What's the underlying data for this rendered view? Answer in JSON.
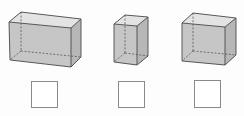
{
  "diagram": {
    "type": "cuboid-comparison-worksheet",
    "colors": {
      "background": "#fdfdfd",
      "front_face": "#c6c6c6",
      "top_face": "#e3e3e3",
      "side_face": "#b7b7b7",
      "edge": "#4a4a4a",
      "hidden_edge": "#555555",
      "answer_border": "#8a8a8a"
    },
    "cuboids": [
      {
        "name": "cuboid-1-wide",
        "front": {
          "tl": [
            9,
            22
          ],
          "tr": [
            71,
            28
          ],
          "br": [
            71,
            67
          ],
          "bl": [
            10,
            60
          ]
        },
        "back": {
          "tl": [
            21,
            12
          ],
          "tr": [
            81,
            19
          ],
          "br": [
            81,
            57
          ],
          "bl": [
            21,
            51
          ]
        }
      },
      {
        "name": "cuboid-2-tall",
        "front": {
          "tl": [
            114,
            24
          ],
          "tr": [
            137,
            26
          ],
          "br": [
            137,
            65
          ],
          "bl": [
            114,
            62
          ]
        },
        "back": {
          "tl": [
            125,
            15
          ],
          "tr": [
            148,
            17
          ],
          "br": [
            148,
            56
          ],
          "bl": [
            125,
            53
          ]
        }
      },
      {
        "name": "cuboid-3-medium",
        "front": {
          "tl": [
            182,
            23
          ],
          "tr": [
            225,
            27
          ],
          "br": [
            225,
            65
          ],
          "bl": [
            182,
            61
          ]
        },
        "back": {
          "tl": [
            193,
            13
          ],
          "tr": [
            236,
            18
          ],
          "br": [
            236,
            55
          ],
          "bl": [
            193,
            51
          ]
        }
      }
    ],
    "answer_boxes": [
      {
        "x": 31,
        "y": 81,
        "w": 27,
        "h": 27,
        "value": ""
      },
      {
        "x": 118,
        "y": 81,
        "w": 27,
        "h": 27,
        "value": ""
      },
      {
        "x": 194,
        "y": 80,
        "w": 27,
        "h": 28,
        "value": ""
      }
    ]
  }
}
